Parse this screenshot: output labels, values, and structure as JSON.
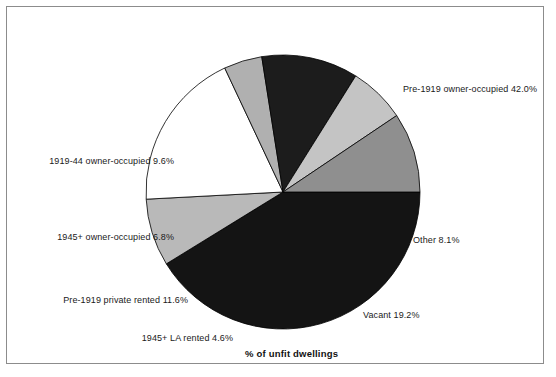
{
  "figure": {
    "width": 556,
    "height": 377,
    "background": "#ffffff",
    "border_color": "#8c8c8c",
    "axis_title": "% of unfit dwellings"
  },
  "chart_data": {
    "type": "pie",
    "title": "",
    "subtitle": "",
    "xlabel": "% of unfit dwellings",
    "ylabel": "",
    "grid": false,
    "legend": "none",
    "label_format": "{name} {value}%",
    "start_angle_deg": 0,
    "direction": "clockwise",
    "center": {
      "x": 283,
      "y": 192
    },
    "radius": 137,
    "categories": [
      "Pre-1919 owner-occupied",
      "Other",
      "Vacant",
      "1945+ LA rented",
      "Pre-1919 private rented",
      "1945+ owner-occupied",
      "1919-44 owner-occupied"
    ],
    "values": [
      42.0,
      8.1,
      19.2,
      4.6,
      11.6,
      6.8,
      9.6
    ],
    "slices": [
      {
        "name": "Pre-1919 owner-occupied",
        "value": 42.0,
        "label": "Pre-1919 owner-occupied 42.0%",
        "fill": "#141414",
        "pattern": "solid-black"
      },
      {
        "name": "Other",
        "value": 8.1,
        "label": "Other 8.1%",
        "fill": "#b9b9b9",
        "pattern": "light-grey"
      },
      {
        "name": "Vacant",
        "value": 19.2,
        "label": "Vacant 19.2%",
        "fill": "#ffffff",
        "pattern": "white"
      },
      {
        "name": "1945+ LA rented",
        "value": 4.6,
        "label": "1945+ LA rented 4.6%",
        "fill": "#b0b0b0",
        "pattern": "mid-grey"
      },
      {
        "name": "Pre-1919 private rented",
        "value": 11.6,
        "label": "Pre-1919 private rented 11.6%",
        "fill": "#1c1c1c",
        "pattern": "solid-black"
      },
      {
        "name": "1945+ owner-occupied",
        "value": 6.8,
        "label": "1945+ owner-occupied 6.8%",
        "fill": "#c4c4c4",
        "pattern": "light-grey"
      },
      {
        "name": "1919-44 owner-occupied",
        "value": 9.6,
        "label": "1919-44 owner-occupied 9.6%",
        "fill": "#8f8f8f",
        "pattern": "dark-grey"
      }
    ]
  }
}
